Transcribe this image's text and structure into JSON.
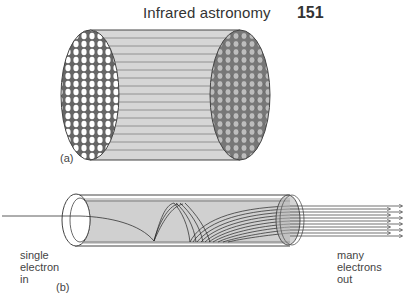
{
  "header": {
    "title": "Infrared astronomy",
    "page_number": "151"
  },
  "figure": {
    "panel_a": {
      "label": "(a)",
      "description": "microchannel plate: bundle of many parallel tubes"
    },
    "panel_b": {
      "label": "(b)",
      "input_label": [
        "single",
        "electron",
        "in"
      ],
      "output_label": [
        "many",
        "electrons",
        "out"
      ]
    },
    "colors": {
      "tube_fill": "#cfcfcf",
      "line": "#333333",
      "background": "#ffffff"
    }
  }
}
